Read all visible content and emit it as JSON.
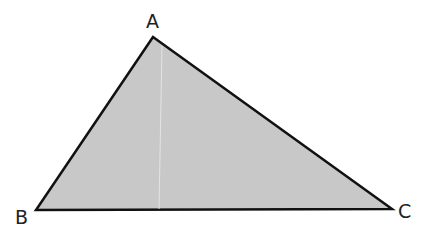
{
  "diagram": {
    "type": "triangle",
    "fill_color": "#c8c8c8",
    "stroke_color": "#111111",
    "vertices": [
      {
        "label": "A",
        "x": 153,
        "y": 37
      },
      {
        "label": "B",
        "x": 36,
        "y": 210
      },
      {
        "label": "C",
        "x": 392,
        "y": 209
      }
    ]
  }
}
